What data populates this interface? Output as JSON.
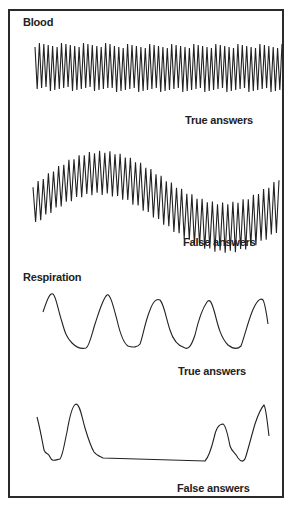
{
  "figure": {
    "sections": [
      {
        "title": "Blood",
        "traces": [
          {
            "caption": "True answers"
          },
          {
            "caption": "False answers"
          }
        ]
      },
      {
        "title": "Respiration",
        "traces": [
          {
            "caption": "True answers"
          },
          {
            "caption": "False answers"
          }
        ]
      }
    ],
    "colors": {
      "ink": "#222222",
      "frame": "#2a2a2a",
      "background": "#ffffff"
    }
  }
}
